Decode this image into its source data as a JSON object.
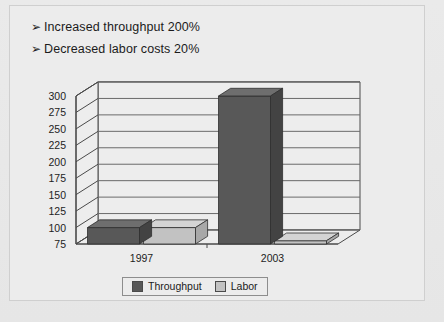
{
  "slide": {
    "bullets": [
      {
        "marker": "➢",
        "text": "Increased throughput 200%"
      },
      {
        "marker": "➢",
        "text": "Decreased labor costs 20%"
      }
    ]
  },
  "colors": {
    "throughput": "#585858",
    "throughput_top": "#6e6e6e",
    "throughput_side": "#434343",
    "labor": "#c2c2c2",
    "labor_top": "#d4d4d4",
    "labor_side": "#a8a8a8",
    "wall": "#ededed",
    "gridline": "#6a6a6a",
    "axis": "#4a4a4a",
    "text": "#1b1b1b"
  },
  "chart_data": {
    "type": "bar",
    "title": "",
    "xlabel": "",
    "ylabel": "",
    "categories": [
      "1997",
      "2003"
    ],
    "series": [
      {
        "name": "Throughput",
        "values": [
          100,
          300
        ],
        "color": "#585858"
      },
      {
        "name": "Labor",
        "values": [
          100,
          80
        ],
        "color": "#c2c2c2"
      }
    ],
    "ylim": [
      75,
      300
    ],
    "ytick_step": 25,
    "yticks": [
      300,
      275,
      250,
      225,
      200,
      175,
      150,
      125,
      100,
      75
    ],
    "grid": true,
    "three_d": true,
    "legend_position": "bottom",
    "legend_entries": [
      "Throughput",
      "Labor"
    ]
  }
}
